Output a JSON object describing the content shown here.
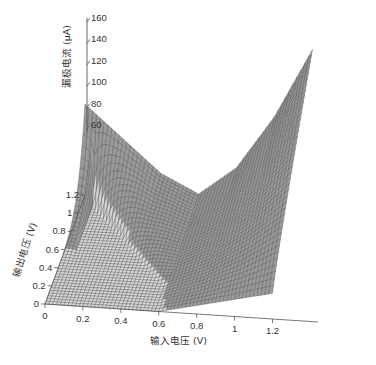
{
  "chart_data": {
    "type": "surface",
    "title": "",
    "xlabel": "输入电压 (V)",
    "ylabel": "输出电压 (V)",
    "zlabel": "漏极电流 (μA)",
    "x_ticks": [
      "0",
      "0.2",
      "0.4",
      "0.6",
      "0.8",
      "1",
      "1.2"
    ],
    "y_ticks": [
      "0",
      "0.2",
      "0.4",
      "0.6",
      "0.8",
      "1",
      "1.2"
    ],
    "z_ticks": [
      "60",
      "80",
      "100",
      "120",
      "140",
      "160"
    ],
    "x_range": [
      0,
      1.2
    ],
    "y_range": [
      0,
      1.2
    ],
    "z_range": [
      0,
      160
    ],
    "grid": false,
    "legend": null,
    "surface_samples": {
      "x": [
        0,
        0.2,
        0.4,
        0.6,
        0.8,
        1.0,
        1.2
      ],
      "y_at_max": 1.2,
      "z_at_y_max": [
        85,
        55,
        25,
        8,
        35,
        85,
        150
      ],
      "note_min_x": 0.6
    },
    "mesh_color": "#4a4a4a",
    "background": "#ffffff"
  }
}
